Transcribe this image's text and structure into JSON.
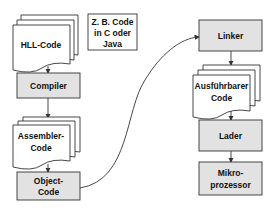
{
  "diagram": {
    "colors": {
      "box_fill": "#e2e2e2",
      "doc_fill": "#ffffff",
      "stroke": "#333333",
      "text": "#111111"
    },
    "left_column": {
      "hll_code": [
        "HLL-Code"
      ],
      "note": [
        "Z. B. Code",
        "in C oder",
        "Java"
      ],
      "compiler": [
        "Compiler"
      ],
      "assembler_code": [
        "Assembler-",
        "Code"
      ],
      "object_code": [
        "Object-",
        "Code"
      ]
    },
    "right_column": {
      "linker": [
        "Linker"
      ],
      "executable_code": [
        "Ausführbarer",
        "Code"
      ],
      "loader": [
        "Lader"
      ],
      "microprocessor": [
        "Mikro-",
        "prozessor"
      ]
    },
    "edges": [
      [
        "HLL-Code",
        "Compiler"
      ],
      [
        "Compiler",
        "Assembler-Code"
      ],
      [
        "Assembler-Code",
        "Object-Code"
      ],
      [
        "Object-Code",
        "Linker"
      ],
      [
        "Linker",
        "Ausführbarer Code"
      ],
      [
        "Ausführbarer Code",
        "Lader"
      ],
      [
        "Lader",
        "Mikroprozessor"
      ]
    ]
  }
}
